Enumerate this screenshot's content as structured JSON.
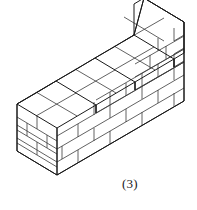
{
  "figure": {
    "caption": "(3)",
    "colors": {
      "background": "#ffffff",
      "edge_stroke": "#1a1a1a",
      "mortar_stroke": "#3a3a3a",
      "face_fill": "#ffffff"
    },
    "geometry": {
      "type": "isometric-line-drawing",
      "steps": 4,
      "front_face_courses": [
        3,
        4,
        5,
        6
      ],
      "left_end_courses": 3,
      "right_end_courses": 6,
      "top_surface_bricks": 4,
      "units_label": "bricks"
    },
    "notes": {
      "left_vertex": "17,104",
      "bottom_vertex": "57,175",
      "right_vertex": "184,22",
      "peak_clipped_top": "140,0"
    }
  }
}
